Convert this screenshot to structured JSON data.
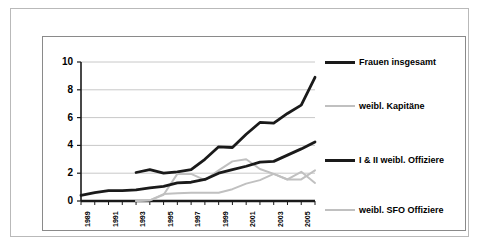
{
  "chart_data": {
    "type": "line",
    "title": "",
    "subtitle": "",
    "xlabel": "",
    "ylabel": "",
    "ylim": [
      0,
      10
    ],
    "yticks": [
      "0",
      "2",
      "4",
      "6",
      "8",
      "10"
    ],
    "grid": true,
    "legend_position": "right",
    "x": [
      1989,
      1990,
      1991,
      1992,
      1993,
      1994,
      1995,
      1996,
      1997,
      1998,
      1999,
      2000,
      2001,
      2002,
      2003,
      2004,
      2005,
      2006
    ],
    "xtick_labels": [
      "1989",
      "1991",
      "1993",
      "1995",
      "1997",
      "1999",
      "2001",
      "2003",
      "2005"
    ],
    "xtick_values": [
      1989,
      1991,
      1993,
      1995,
      1997,
      1999,
      2001,
      2003,
      2005
    ],
    "series": [
      {
        "name": "Frauen insgesamt",
        "color": "#1a1a1a",
        "width": "thick",
        "x": [
          1993,
          1994,
          1995,
          1996,
          1997,
          1998,
          1999,
          2000,
          2001,
          2002,
          2003,
          2004,
          2005,
          2006
        ],
        "values": [
          2.05,
          2.25,
          2.0,
          2.1,
          2.25,
          3.0,
          3.9,
          3.85,
          4.8,
          5.65,
          5.6,
          6.3,
          6.9,
          8.9
        ]
      },
      {
        "name": "weibl. Kapitäne",
        "color": "#c0c0c0",
        "width": "thin",
        "x": [
          1993,
          1994,
          1995,
          1996,
          1997,
          1998,
          1999,
          2000,
          2001,
          2002,
          2003,
          2004,
          2005,
          2006
        ],
        "values": [
          0.0,
          0.05,
          0.45,
          1.95,
          1.95,
          1.5,
          2.2,
          2.85,
          3.0,
          2.3,
          1.95,
          1.55,
          2.1,
          1.3
        ]
      },
      {
        "name": "I & II weibl. Offiziere",
        "color": "#1a1a1a",
        "width": "thick",
        "x": [
          1989,
          1990,
          1991,
          1992,
          1993,
          1994,
          1995,
          1996,
          1997,
          1998,
          1999,
          2000,
          2001,
          2002,
          2003,
          2004,
          2005,
          2006
        ],
        "values": [
          0.4,
          0.6,
          0.75,
          0.75,
          0.8,
          0.95,
          1.05,
          1.3,
          1.35,
          1.55,
          2.0,
          2.25,
          2.5,
          2.8,
          2.85,
          3.3,
          3.75,
          4.25
        ]
      },
      {
        "name": "weibl. SFO Offiziere",
        "color": "#c0c0c0",
        "width": "thin",
        "x": [
          1993,
          1994,
          1995,
          1996,
          1997,
          1998,
          1999,
          2000,
          2001,
          2002,
          2003,
          2004,
          2005,
          2006
        ],
        "values": [
          0.0,
          0.05,
          0.5,
          0.55,
          0.6,
          0.6,
          0.6,
          0.85,
          1.25,
          1.5,
          1.95,
          1.55,
          1.55,
          2.2
        ]
      }
    ]
  },
  "legend": {
    "items": [
      {
        "label": "Frauen insgesamt"
      },
      {
        "label": "weibl. Kapitäne"
      },
      {
        "label": "I & II weibl. Offiziere"
      },
      {
        "label": "weibl. SFO Offiziere"
      }
    ]
  },
  "colors": {
    "series_dark": "#1a1a1a",
    "series_gray": "#c0c0c0",
    "gridline": "#c8c8c8",
    "axis": "#1a1a1a",
    "outer_frame": "#b9b9b9",
    "panel_border": "#8a8a8a",
    "background": "#ffffff"
  }
}
